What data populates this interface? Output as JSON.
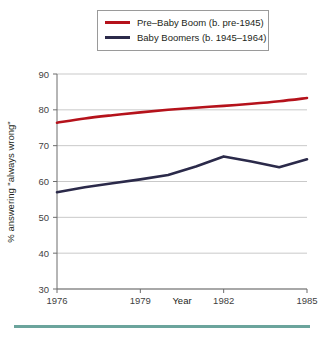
{
  "legend": {
    "position": "top-center",
    "items": [
      {
        "label": "Pre–Baby Boom (b. pre-1945)",
        "color": "#b5121b",
        "swatch": "line-swatch-red"
      },
      {
        "label": "Baby Boomers (b. 1945–1964)",
        "color": "#2b2a4a",
        "swatch": "line-swatch-navy"
      }
    ]
  },
  "axes": {
    "xlabel": "Year",
    "ylabel": "% answering \"always wrong\"",
    "yticks": [
      "90",
      "80",
      "70",
      "60",
      "50",
      "40",
      "30"
    ],
    "xticks": [
      "1976",
      "1979",
      "1982",
      "1985"
    ]
  },
  "colors": {
    "red": "#b5121b",
    "navy": "#2b2a4a",
    "grid": "#c9c9c9",
    "axis": "#6d6d6d",
    "rule": "#6ba49c",
    "background": "#ffffff"
  },
  "chart_data": {
    "type": "line",
    "title": "",
    "xlabel": "Year",
    "ylabel": "% answering \"always wrong\"",
    "xlim": [
      1976,
      1985
    ],
    "ylim": [
      30,
      90
    ],
    "yticks": [
      30,
      40,
      50,
      60,
      70,
      80,
      90
    ],
    "xticks": [
      1976,
      1979,
      1982,
      1985
    ],
    "grid": "horizontal",
    "legend_position": "top-center",
    "x": [
      1976,
      1977,
      1978,
      1979,
      1980,
      1981,
      1982,
      1983,
      1984,
      1985
    ],
    "series": [
      {
        "name": "Pre–Baby Boom (b. pre-1945)",
        "color": "#b5121b",
        "values": [
          76.4,
          77.6,
          78.5,
          79.3,
          80.0,
          80.6,
          81.1,
          81.7,
          82.4,
          83.3
        ]
      },
      {
        "name": "Baby Boomers (b. 1945–1964)",
        "color": "#2b2a4a",
        "values": [
          57.0,
          58.4,
          59.5,
          60.6,
          61.8,
          64.2,
          67.0,
          65.6,
          64.0,
          66.2
        ]
      }
    ]
  }
}
